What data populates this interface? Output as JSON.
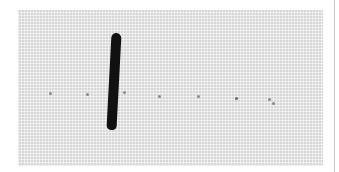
{
  "image": {
    "description": "Grayscale photograph of woven mesh fabric with a dark elongated object and a row of small dots",
    "subject": "dark elongated object on fabric",
    "background_color": "#ffffff",
    "fabric_color": "#d6d6d6",
    "object_color": "#111111",
    "dots": [
      {
        "x": 49,
        "y": 92
      },
      {
        "x": 86,
        "y": 93
      },
      {
        "x": 123,
        "y": 91
      },
      {
        "x": 158,
        "y": 95
      },
      {
        "x": 197,
        "y": 95
      },
      {
        "x": 235,
        "y": 97
      },
      {
        "x": 268,
        "y": 98
      },
      {
        "x": 272,
        "y": 102
      }
    ]
  }
}
